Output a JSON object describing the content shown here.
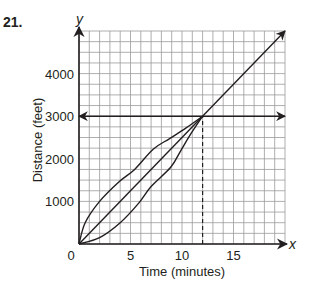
{
  "problem_number": "21.",
  "chart_data": {
    "type": "line",
    "title": "",
    "xlabel": "Time (minutes)",
    "ylabel": "Distance (feet)",
    "x_axis_variable": "x",
    "y_axis_variable": "y",
    "xlim": [
      0,
      20
    ],
    "ylim": [
      0,
      5000
    ],
    "x_ticks": [
      0,
      5,
      10,
      15
    ],
    "x_tick_labels": [
      "0",
      "5",
      "10",
      "15"
    ],
    "y_ticks": [
      1000,
      2000,
      3000,
      4000
    ],
    "y_tick_labels": [
      "1000",
      "2000",
      "3000",
      "4000"
    ],
    "grid": {
      "on": true,
      "x_minor_step": 1,
      "y_minor_step": 250
    },
    "legend": null,
    "series": [
      {
        "name": "straight line (constant rate)",
        "style": "solid",
        "arrow_end": true,
        "points": [
          [
            0,
            0
          ],
          [
            20,
            5000
          ]
        ]
      },
      {
        "name": "upper curve (concave down)",
        "style": "solid",
        "arrow_end": false,
        "points": [
          [
            0,
            0
          ],
          [
            0.6,
            500
          ],
          [
            2,
            1000
          ],
          [
            3.84,
            1450
          ],
          [
            5.4,
            1750
          ],
          [
            7.2,
            2225
          ],
          [
            8.8,
            2475
          ],
          [
            10.4,
            2725
          ],
          [
            12,
            3000
          ]
        ]
      },
      {
        "name": "lower curve (concave up)",
        "style": "solid",
        "arrow_end": false,
        "points": [
          [
            0,
            0
          ],
          [
            2,
            150
          ],
          [
            4,
            500
          ],
          [
            5.8,
            960
          ],
          [
            7,
            1350
          ],
          [
            8.9,
            1800
          ],
          [
            9.9,
            2200
          ],
          [
            10.9,
            2600
          ],
          [
            12,
            3000
          ]
        ]
      },
      {
        "name": "horizontal line y = 3000",
        "style": "solid",
        "arrow_both_ends": true,
        "points": [
          [
            0,
            3000
          ],
          [
            20,
            3000
          ]
        ]
      },
      {
        "name": "vertical dashed line x = 12",
        "style": "dashed",
        "arrow_end": false,
        "points": [
          [
            12,
            0
          ],
          [
            12,
            3000
          ]
        ]
      }
    ],
    "annotations": [
      {
        "text": "intersection point",
        "x": 12,
        "y": 3000
      }
    ]
  },
  "colors": {
    "ink": "#231f20",
    "grid": "#9a9a9a",
    "background": "#ffffff"
  }
}
